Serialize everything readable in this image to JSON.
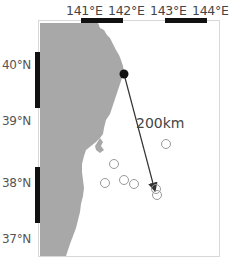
{
  "map": {
    "lon_labels": [
      "141°E",
      "142°E",
      "143°E",
      "144°E"
    ],
    "lat_labels": [
      "40°N",
      "39°N",
      "38°N",
      "37°N"
    ],
    "distance_label": "200km",
    "colors": {
      "land": "#a8a8a8",
      "sea": "#ffffff",
      "scale_bar": "#111111",
      "site_marker": "#111111",
      "event_circle": "#999999",
      "arrow": "#333333"
    },
    "site": {
      "label": "",
      "x": 124,
      "y": 74
    },
    "arrow_end": {
      "x": 156,
      "y": 193
    },
    "event_circles": [
      {
        "x": 166,
        "y": 144
      },
      {
        "x": 114,
        "y": 164
      },
      {
        "x": 105,
        "y": 183
      },
      {
        "x": 124,
        "y": 180
      },
      {
        "x": 134,
        "y": 184
      },
      {
        "x": 156,
        "y": 189
      },
      {
        "x": 157,
        "y": 195
      }
    ]
  }
}
